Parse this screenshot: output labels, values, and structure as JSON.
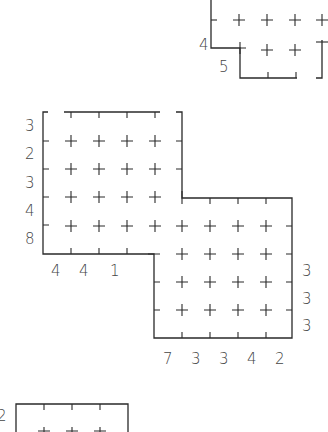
{
  "puzzle_top_right": {
    "row_labels": [
      {
        "text": "4",
        "x": 199,
        "y": 37
      },
      {
        "text": "5",
        "x": 219,
        "y": 59
      }
    ]
  },
  "puzzle_main": {
    "row_labels": [
      {
        "text": "3",
        "x": 25,
        "y": 118
      },
      {
        "text": "2",
        "x": 25,
        "y": 146
      },
      {
        "text": "3",
        "x": 25,
        "y": 175
      },
      {
        "text": "4",
        "x": 25,
        "y": 203
      },
      {
        "text": "8",
        "x": 25,
        "y": 231
      }
    ],
    "bottom_left_col_labels": [
      {
        "text": "4",
        "x": 51,
        "y": 263
      },
      {
        "text": "4",
        "x": 79,
        "y": 263
      },
      {
        "text": "1",
        "x": 110,
        "y": 263
      }
    ],
    "right_row_labels": [
      {
        "text": "3",
        "x": 302,
        "y": 263
      },
      {
        "text": "3",
        "x": 302,
        "y": 291
      },
      {
        "text": "3",
        "x": 302,
        "y": 318
      }
    ],
    "bottom_col_labels": [
      {
        "text": "7",
        "x": 163,
        "y": 351
      },
      {
        "text": "3",
        "x": 191,
        "y": 351
      },
      {
        "text": "3",
        "x": 219,
        "y": 351
      },
      {
        "text": "4",
        "x": 247,
        "y": 351
      },
      {
        "text": "2",
        "x": 275,
        "y": 351
      }
    ]
  },
  "puzzle_bottom_left": {
    "row_labels": [
      {
        "text": "2",
        "x": -3,
        "y": 408
      }
    ]
  }
}
